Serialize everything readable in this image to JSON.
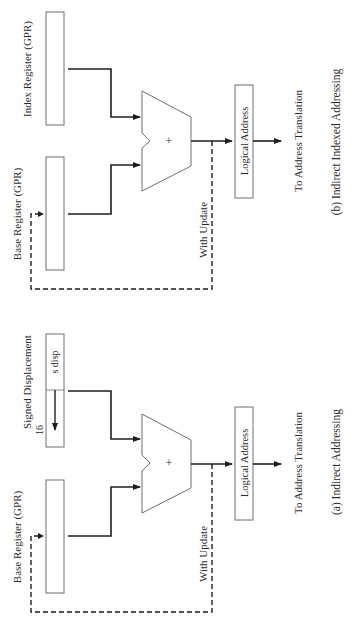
{
  "diagram": {
    "orientation": "rotated 90 degrees counter-clockwise",
    "panels": [
      {
        "id": "b",
        "caption": "(b) Indirect Indexed Addressing",
        "inputs": [
          {
            "label": "Index Register (GPR)"
          },
          {
            "label": "Base Register (GPR)"
          }
        ],
        "adder_symbol": "+",
        "feedback_label": "With Update",
        "output_box": "Logical Address",
        "output_label": "To Address Translation"
      },
      {
        "id": "a",
        "caption": "(a) Indirect Addressing",
        "inputs": [
          {
            "label": "Signed Displacement",
            "width": "16",
            "field": "s disp"
          },
          {
            "label": "Base Register (GPR)"
          }
        ],
        "adder_symbol": "+",
        "feedback_label": "With Update",
        "output_box": "Logical Address",
        "output_label": "To Address Translation"
      }
    ]
  },
  "colors": {
    "line": "#1e1e1e",
    "box_stroke": "#6e6e6e",
    "text": "#2a2a2a",
    "background": "#ffffff"
  }
}
